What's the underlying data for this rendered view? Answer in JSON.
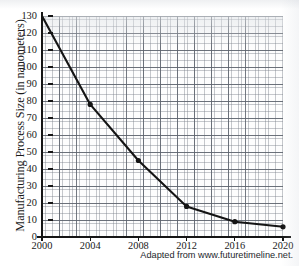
{
  "chart_data": {
    "type": "line",
    "title": "",
    "xlabel": "",
    "ylabel": "Manufacturing Process Size (in nanometers)",
    "x": [
      2000,
      2004,
      2008,
      2012,
      2016,
      2020
    ],
    "values": [
      130,
      78,
      45,
      18,
      9,
      6
    ],
    "series": [
      {
        "name": "Manufacturing Process Size",
        "values": [
          130,
          78,
          45,
          18,
          9,
          6
        ]
      }
    ],
    "categories": [
      "2000",
      "2004",
      "2008",
      "2012",
      "2016",
      "2020"
    ],
    "xlim": [
      2000,
      2020
    ],
    "ylim": [
      0,
      130
    ],
    "x_tick_labels": [
      "2000",
      "2004",
      "2008",
      "2012",
      "2016",
      "2020"
    ],
    "y_tick_labels": [
      "0",
      "10",
      "20",
      "30",
      "40",
      "50",
      "60",
      "70",
      "80",
      "90",
      "100",
      "110",
      "120",
      "130"
    ],
    "y_tick_values": [
      0,
      10,
      20,
      30,
      40,
      50,
      60,
      70,
      80,
      90,
      100,
      110,
      120,
      130
    ],
    "grid": true,
    "grid_style": "graph-paper minor and major gridlines",
    "legend": false,
    "legend_position": "none",
    "marker": "filled-circle",
    "line_color": "#141414",
    "annotations": []
  },
  "caption": {
    "source_note": "Adapted from www.futuretimeline.net."
  }
}
